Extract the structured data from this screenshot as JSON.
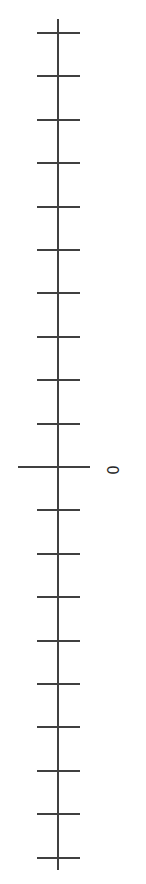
{
  "figure": {
    "kind": "vertical-axis",
    "background_color": "#ffffff",
    "width": 146,
    "height": 884
  },
  "chart_data": {
    "type": "line",
    "title": "",
    "subtitle": "",
    "xlabel": "",
    "ylabel": "",
    "grid": false,
    "legend": [],
    "legend_position": "none",
    "series": [],
    "orientation": "vertical",
    "axis": {
      "orientation": "vertical",
      "spine_color": "#404040",
      "spine_width_px": 2,
      "spine_x_px": 58,
      "spine_top_px": 19,
      "spine_bottom_px": 870,
      "tick_color": "#404040",
      "tick_width_px": 2,
      "minor_tick_left_px": 37,
      "minor_tick_right_px": 80,
      "major_tick_left_px": 18,
      "major_tick_right_px": 90,
      "minor_tick_count": 19,
      "major_tick_count": 1,
      "tick_spacing_px": 43.4,
      "first_tick_y_px": 33,
      "zero_tick_y_px": 467
    },
    "tick_positions_px": [
      33,
      76.4,
      119.8,
      163.2,
      206.6,
      250,
      293.4,
      336.8,
      380.2,
      423.6,
      467,
      510.4,
      553.8,
      597.2,
      640.6,
      684,
      727.4,
      770.8,
      814.2,
      857.6
    ],
    "major_tick_positions_px": [
      467
    ],
    "tick_labels": [
      {
        "text": "0",
        "y_px": 470,
        "x_px": 114,
        "rotation_deg": -90,
        "color": "#262626",
        "font_size_px": 15
      }
    ],
    "labelled_values": [
      0
    ],
    "ylim": [
      null,
      null
    ]
  },
  "colors": {
    "background": "#ffffff",
    "axis_line": "#404040",
    "tick_mark": "#404040",
    "label_text": "#262626"
  }
}
